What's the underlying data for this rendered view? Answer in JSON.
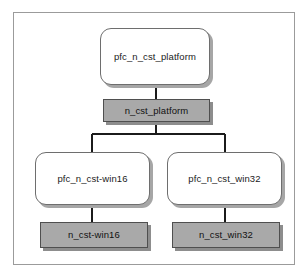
{
  "diagram": {
    "frame": {
      "border_color": "#9b9b9b",
      "background": "#ffffff"
    },
    "palette": {
      "ancestor_fill": "#ffffff",
      "ancestor_border": "#6e6e6e",
      "service_fill": "#a9a9a9",
      "service_border": "#4f4f4f",
      "shadow": "#a6a6a6",
      "connector": "#1b1b1b"
    },
    "nodes": [
      {
        "id": "pfc_platform",
        "label": "pfc_n_cst_platform",
        "shape": "rounded-rect",
        "fill": "white"
      },
      {
        "id": "platform",
        "label": "n_cst_platform",
        "shape": "rect",
        "fill": "gray"
      },
      {
        "id": "pfc_win16",
        "label": "pfc_n_cst-win16",
        "shape": "rounded-rect",
        "fill": "white"
      },
      {
        "id": "pfc_win32",
        "label": "pfc_n_cst_win32",
        "shape": "rounded-rect",
        "fill": "white"
      },
      {
        "id": "win16",
        "label": "n_cst-win16",
        "shape": "rect",
        "fill": "gray"
      },
      {
        "id": "win32",
        "label": "n_cst_win32",
        "shape": "rect",
        "fill": "gray"
      }
    ],
    "edges": [
      {
        "from": "pfc_platform",
        "to": "platform",
        "style": "straight"
      },
      {
        "from": "platform",
        "to": "pfc_win16",
        "style": "elbow"
      },
      {
        "from": "platform",
        "to": "pfc_win32",
        "style": "elbow"
      },
      {
        "from": "pfc_win16",
        "to": "win16",
        "style": "straight"
      },
      {
        "from": "pfc_win32",
        "to": "win32",
        "style": "straight"
      }
    ]
  }
}
